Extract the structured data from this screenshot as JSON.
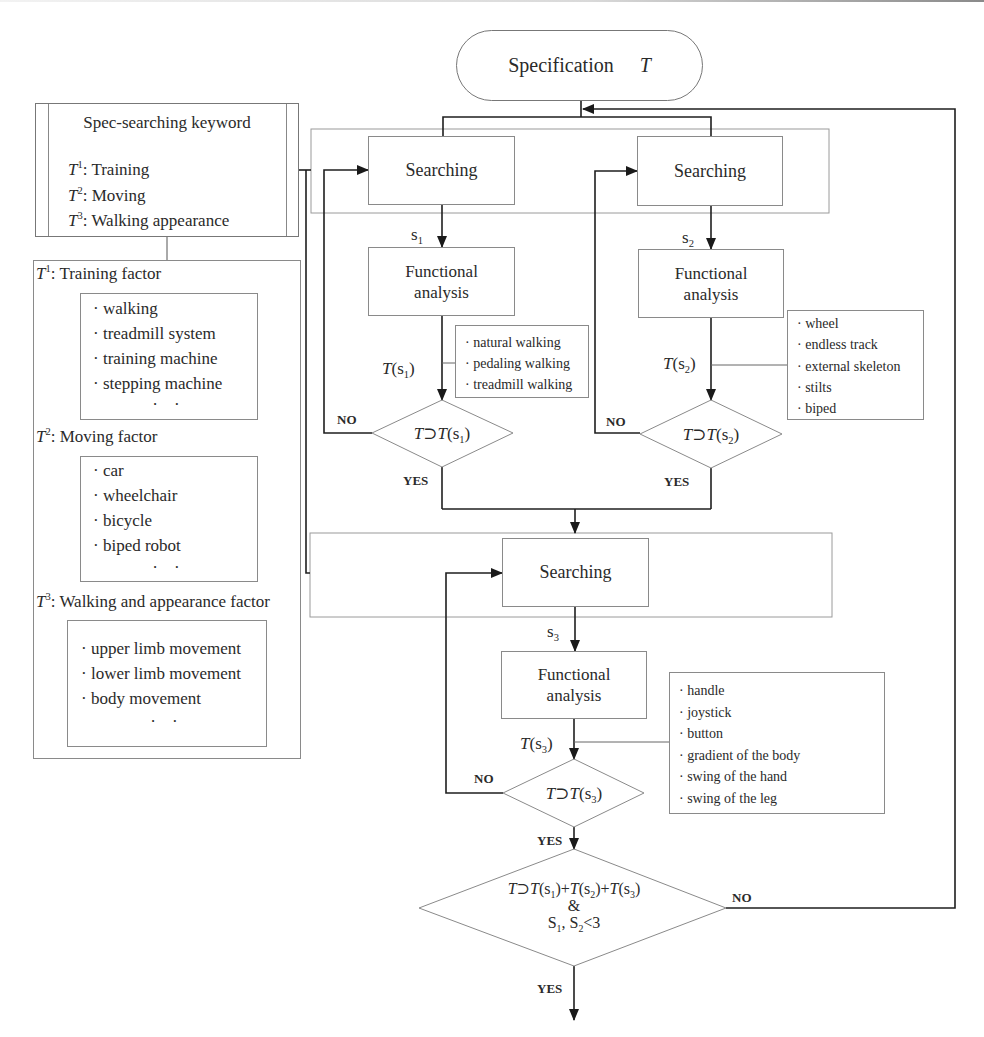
{
  "title": {
    "label": "Specification",
    "symbol": "T"
  },
  "keyword_box": {
    "heading": "Spec-searching keyword",
    "items": [
      {
        "sym": "T",
        "sup": "1",
        "text": ": Training"
      },
      {
        "sym": "T",
        "sup": "2",
        "text": ": Moving"
      },
      {
        "sym": "T",
        "sup": "3",
        "text": ": Walking appearance"
      }
    ]
  },
  "factors": [
    {
      "sym": "T",
      "sup": "1",
      "heading": ": Training factor",
      "items": [
        "· walking",
        "· treadmill system",
        "· training machine",
        "· stepping machine"
      ],
      "ellipsis": "· ·"
    },
    {
      "sym": "T",
      "sup": "2",
      "heading": ": Moving factor",
      "items": [
        "· car",
        "· wheelchair",
        "· bicycle",
        "· biped robot"
      ],
      "ellipsis": "· ·"
    },
    {
      "sym": "T",
      "sup": "3",
      "heading": ": Walking and appearance factor",
      "items": [
        "· upper limb movement",
        "· lower limb movement",
        "· body movement"
      ],
      "ellipsis": "· ·"
    }
  ],
  "stages": [
    {
      "search_label": "Searching",
      "result": {
        "sym": "s",
        "sub": "1"
      },
      "analysis_line1": "Functional",
      "analysis_line2": "analysis",
      "output": {
        "sym": "T",
        "open": "(s",
        "sub": "1",
        "close": ")"
      },
      "output_items": [
        "· natural walking",
        "· pedaling walking",
        "· treadmill walking"
      ],
      "decision": {
        "lhs": "T",
        "op": "⊃",
        "rhs": "T",
        "open": "(s",
        "sub": "1",
        "close": ")"
      },
      "no": "NO",
      "yes": "YES"
    },
    {
      "search_label": "Searching",
      "result": {
        "sym": "s",
        "sub": "2"
      },
      "analysis_line1": "Functional",
      "analysis_line2": "analysis",
      "output": {
        "sym": "T",
        "open": "(s",
        "sub": "2",
        "close": ")"
      },
      "output_items": [
        "· wheel",
        "· endless track",
        "· external skeleton",
        "· stilts",
        "· biped"
      ],
      "decision": {
        "lhs": "T",
        "op": "⊃",
        "rhs": "T",
        "open": "(s",
        "sub": "2",
        "close": ")"
      },
      "no": "NO",
      "yes": "YES"
    },
    {
      "search_label": "Searching",
      "result": {
        "sym": "s",
        "sub": "3"
      },
      "analysis_line1": "Functional",
      "analysis_line2": "analysis",
      "output": {
        "sym": "T",
        "open": "(s",
        "sub": "3",
        "close": ")"
      },
      "output_items": [
        "· handle",
        "· joystick",
        "· button",
        "· gradient of the body",
        "· swing of the hand",
        "· swing of the leg"
      ],
      "decision": {
        "lhs": "T",
        "op": "⊃",
        "rhs": "T",
        "open": "(s",
        "sub": "3",
        "close": ")"
      },
      "no": "NO",
      "yes": "YES"
    }
  ],
  "final_decision": {
    "lhs": "T",
    "op": "⊃",
    "terms": [
      {
        "sym": "T",
        "open": "(s",
        "sub": "1",
        "close": ")"
      },
      {
        "sym": "T",
        "open": "(s",
        "sub": "2",
        "close": ")"
      },
      {
        "sym": "T",
        "open": "(s",
        "sub": "3",
        "close": ")"
      }
    ],
    "plus": "+",
    "line2": "&",
    "line3": {
      "a": "S",
      "a_sub": "1",
      "sep": ", S",
      "b_sub": "2",
      "cmp": "<3"
    },
    "no": "NO",
    "yes": "YES"
  },
  "colors": {
    "line": "#222222",
    "box_border": "#8a8a8a",
    "background": "#ffffff"
  }
}
